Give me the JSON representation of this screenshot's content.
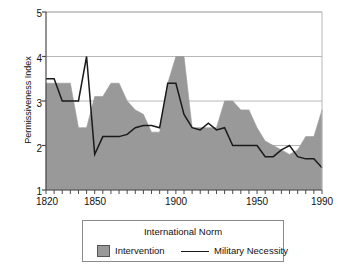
{
  "chart_data": {
    "type": "area",
    "title": "",
    "xlabel": "",
    "ylabel": "Permissiveness Index",
    "xlim": [
      1820,
      1990
    ],
    "ylim": [
      1,
      5
    ],
    "xticks": [
      1820,
      1850,
      1900,
      1950,
      1990
    ],
    "xtick_labels": [
      "1820",
      "1850",
      "1900",
      "1950",
      "1990"
    ],
    "yticks": [
      1,
      2,
      3,
      4,
      5
    ],
    "ytick_labels": [
      "1",
      "2",
      "3",
      "4",
      "5"
    ],
    "minor_tick_interval": 5,
    "grid": "horizontal",
    "legend_position": "below",
    "fill_color": "#999999",
    "line_color": "#1a1a1a",
    "series": [
      {
        "name": "Intervention",
        "render": "area",
        "x": [
          1820,
          1825,
          1830,
          1835,
          1840,
          1845,
          1850,
          1855,
          1860,
          1865,
          1870,
          1875,
          1880,
          1885,
          1890,
          1895,
          1900,
          1905,
          1910,
          1915,
          1920,
          1925,
          1930,
          1935,
          1940,
          1945,
          1950,
          1955,
          1960,
          1965,
          1970,
          1975,
          1980,
          1985,
          1990
        ],
        "values": [
          3.4,
          3.4,
          3.4,
          3.4,
          2.4,
          2.4,
          3.1,
          3.1,
          3.4,
          3.4,
          3.0,
          2.8,
          2.7,
          2.3,
          2.3,
          3.4,
          4.0,
          4.0,
          2.4,
          2.4,
          2.4,
          2.4,
          3.0,
          3.0,
          2.8,
          2.8,
          2.4,
          2.1,
          2.0,
          1.9,
          1.8,
          1.9,
          2.2,
          2.2,
          2.8
        ]
      },
      {
        "name": "Military Necessity",
        "render": "line",
        "x": [
          1820,
          1825,
          1830,
          1835,
          1840,
          1845,
          1850,
          1855,
          1860,
          1865,
          1870,
          1875,
          1880,
          1885,
          1890,
          1895,
          1900,
          1905,
          1910,
          1915,
          1920,
          1925,
          1930,
          1935,
          1940,
          1945,
          1950,
          1955,
          1960,
          1965,
          1970,
          1975,
          1980,
          1985,
          1990
        ],
        "values": [
          3.5,
          3.5,
          3.0,
          3.0,
          3.0,
          4.0,
          1.8,
          2.2,
          2.2,
          2.2,
          2.25,
          2.4,
          2.45,
          2.45,
          2.4,
          3.4,
          3.4,
          2.7,
          2.4,
          2.35,
          2.5,
          2.35,
          2.4,
          2.0,
          2.0,
          2.0,
          2.0,
          1.75,
          1.75,
          1.9,
          2.0,
          1.75,
          1.7,
          1.7,
          1.5
        ]
      }
    ]
  },
  "legend": {
    "title": "International Norm",
    "items": [
      {
        "label": "Intervention",
        "marker": "swatch"
      },
      {
        "label": "Military Necessity",
        "marker": "line"
      }
    ]
  }
}
